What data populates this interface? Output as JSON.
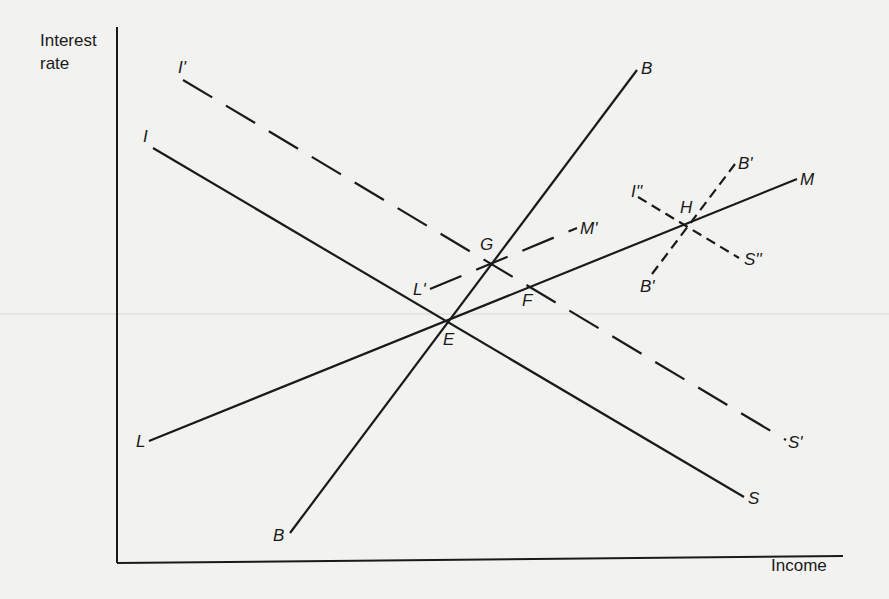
{
  "figure": {
    "type": "IS-LM-BP diagram",
    "y_axis_label_line1": "Interest",
    "y_axis_label_line2": "rate",
    "x_axis_label": "Income"
  },
  "curves": [
    {
      "id": "IS",
      "start_label": "I",
      "end_label": "S",
      "style": "solid",
      "kind": "downward"
    },
    {
      "id": "IS_prime",
      "start_label": "I'",
      "end_label": "S'",
      "style": "long-dash",
      "kind": "downward"
    },
    {
      "id": "IS_double_prime",
      "start_label": "I''",
      "end_label": "S''",
      "style": "short-dash",
      "kind": "downward"
    },
    {
      "id": "LM",
      "start_label": "L",
      "end_label": "M",
      "style": "solid",
      "kind": "upward"
    },
    {
      "id": "LM_prime",
      "start_label": "L'",
      "end_label": "M'",
      "style": "long-dash",
      "kind": "upward"
    },
    {
      "id": "BP",
      "start_label": "B",
      "end_label": "B",
      "style": "solid",
      "kind": "steep-upward"
    },
    {
      "id": "BP_prime",
      "start_label": "B'",
      "end_label": "B'",
      "style": "short-dash",
      "kind": "steep-upward"
    }
  ],
  "intersections": [
    {
      "label": "E",
      "curves": [
        "IS",
        "LM",
        "BP"
      ]
    },
    {
      "label": "F",
      "curves": [
        "IS_prime",
        "LM"
      ]
    },
    {
      "label": "G",
      "curves": [
        "IS_prime",
        "LM_prime",
        "BP"
      ]
    },
    {
      "label": "H",
      "curves": [
        "IS_double_prime",
        "LM",
        "BP_prime"
      ]
    }
  ]
}
